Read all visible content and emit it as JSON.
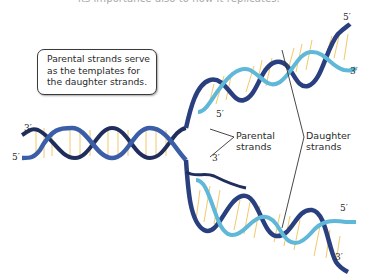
{
  "caption": {
    "top_text": "its importance also to how it replicates."
  },
  "callout": {
    "lines": [
      "Parental strands serve",
      "as the templates for",
      "the daughter strands."
    ]
  },
  "labels": {
    "parental": [
      "Parental",
      "strands"
    ],
    "daughter": [
      "Daughter",
      "strands"
    ]
  },
  "ends": {
    "left_top": "3′",
    "left_bottom": "5′",
    "upper_fork_inner": "5′",
    "upper_right_top": "5′",
    "upper_right_bottom": "3′",
    "lower_fork_inner": "3′",
    "lower_right_top": "5′",
    "lower_right_bottom": "3′"
  },
  "colors": {
    "parental_strand_dark": "#1f2e5c",
    "parental_strand_blue": "#3a5ea8",
    "daughter_strand": "#5fb8d8",
    "base_pairs": "#f0c050",
    "leader_lines": "#333333"
  }
}
